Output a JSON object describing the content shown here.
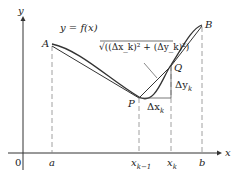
{
  "diagram": {
    "axis_labels": {
      "x": "x",
      "y": "y",
      "origin": "0"
    },
    "function_label": "y = f(x)",
    "points": {
      "A": "A",
      "B": "B",
      "P": "P",
      "Q": "Q"
    },
    "x_ticks": [
      "a",
      "x_{k-1}",
      "x_k",
      "b"
    ],
    "tick_text": {
      "a": "a",
      "xk1_base": "x",
      "xk1_sub": "k−1",
      "xk_base": "x",
      "xk_sub": "k",
      "b": "b"
    },
    "segment_label": "√((Δx_k)² + (Δy_k)²)",
    "delta_x": {
      "base": "Δx",
      "sub": "k"
    },
    "delta_y": {
      "base": "Δy",
      "sub": "k"
    },
    "colors": {
      "curve": "#333333",
      "axis": "#333333",
      "dashed": "#888888"
    }
  }
}
